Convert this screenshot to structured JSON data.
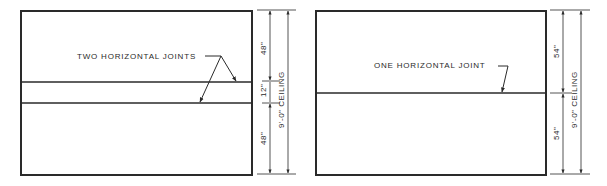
{
  "figures": [
    {
      "id": "two-joint-wall",
      "callout": "TWO HORIZONTAL JOINTS",
      "dimensions": {
        "top": "48\"",
        "middle": "12\"",
        "bottom": "48\"",
        "overall": "9'-0\" CEILING"
      }
    },
    {
      "id": "one-joint-wall",
      "callout": "ONE HORIZONTAL JOINT",
      "dimensions": {
        "top": "54\"",
        "bottom": "54\"",
        "overall": "9'-0\" CEILING"
      }
    }
  ],
  "colors": {
    "line": "#2a2a2a",
    "background": "#ffffff"
  }
}
